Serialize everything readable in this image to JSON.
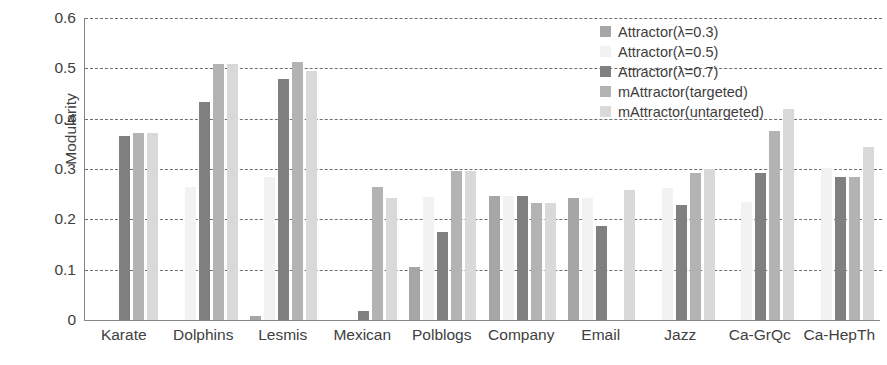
{
  "chart_data": {
    "type": "bar",
    "title": "",
    "subtitle": "",
    "xlabel": "",
    "ylabel": "Modularity",
    "ylim": [
      0,
      0.6
    ],
    "yticks": [
      "0",
      "0.1",
      "0.2",
      "0.3",
      "0.4",
      "0.5",
      "0.6"
    ],
    "ytick_values": [
      0,
      0.1,
      0.2,
      0.3,
      0.4,
      0.5,
      0.6
    ],
    "grid": true,
    "legend_position": "top-right",
    "categories": [
      "Karate",
      "Dolphins",
      "Lesmis",
      "Mexican",
      "Polblogs",
      "Company",
      "Email",
      "Jazz",
      "Ca-GrQc",
      "Ca-HepTh"
    ],
    "series": [
      {
        "name": "Attractor(λ=0.3)",
        "color": "#a6a6a6",
        "values": [
          0,
          0,
          0.008,
          0,
          0.105,
          0.247,
          0.243,
          0,
          0,
          0
        ]
      },
      {
        "name": "Attractor(λ=0.5)",
        "color": "#f2f2f2",
        "values": [
          0,
          0.265,
          0.285,
          0,
          0.245,
          0.247,
          0.243,
          0.262,
          0.235,
          0.303
        ]
      },
      {
        "name": "Attractor(λ=0.7)",
        "color": "#808080",
        "values": [
          0.366,
          0.434,
          0.479,
          0.018,
          0.175,
          0.247,
          0.187,
          0.229,
          0.292,
          0.285
        ]
      },
      {
        "name": "mAttractor(targeted)",
        "color": "#b3b3b3",
        "values": [
          0.372,
          0.508,
          0.513,
          0.264,
          0.297,
          0.232,
          0,
          0.292,
          0.376,
          0.285
        ]
      },
      {
        "name": "mAttractor(untargeted)",
        "color": "#d9d9d9",
        "values": [
          0.372,
          0.508,
          0.494,
          0.243,
          0.297,
          0.232,
          0.259,
          0.3,
          0.42,
          0.344
        ]
      }
    ]
  }
}
